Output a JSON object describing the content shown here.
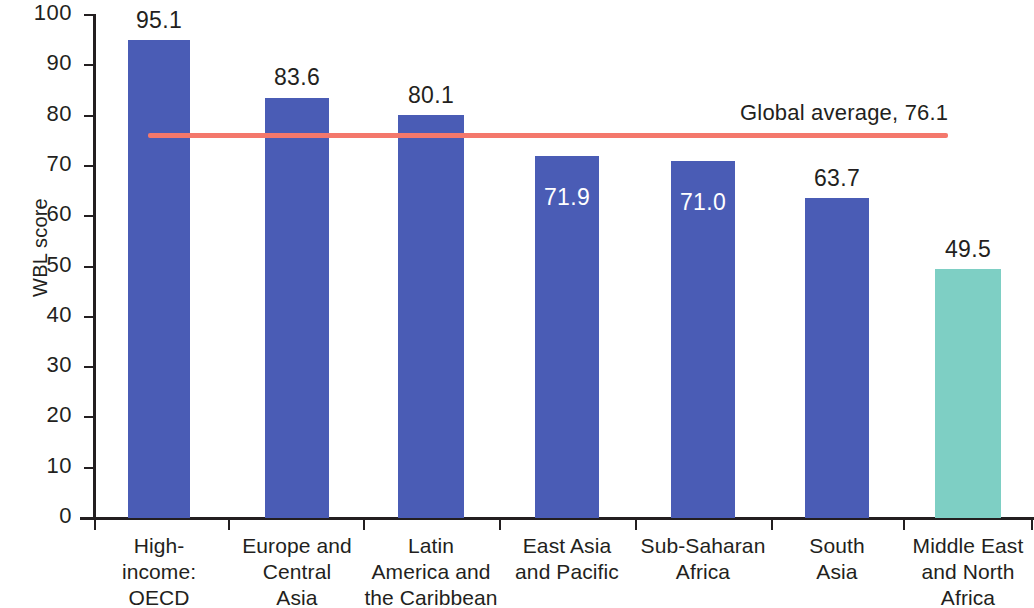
{
  "chart_data": {
    "type": "bar",
    "title": "",
    "subtitle": "",
    "xlabel": "",
    "ylabel": "WBL score",
    "ylim": [
      0,
      100
    ],
    "ytick_labels": [
      "100",
      "90",
      "80",
      "70",
      "60",
      "50",
      "40",
      "30",
      "20",
      "10",
      "0"
    ],
    "ytick_values": [
      100,
      90,
      80,
      70,
      60,
      50,
      40,
      30,
      20,
      10,
      0
    ],
    "grid": false,
    "legend": "none",
    "categories": [
      "High-income: OECD",
      "Europe and Central Asia",
      "Latin America and the Caribbean",
      "East Asia and Pacific",
      "Sub-Saharan Africa",
      "South Asia",
      "Middle East and North Africa"
    ],
    "category_lines": [
      [
        "High-",
        "income:",
        "OECD"
      ],
      [
        "Europe and",
        "Central",
        "Asia"
      ],
      [
        "Latin",
        "America and",
        "the Caribbean"
      ],
      [
        "East Asia",
        "and Pacific"
      ],
      [
        "Sub-Saharan",
        "Africa"
      ],
      [
        "South",
        "Asia"
      ],
      [
        "Middle East",
        "and North",
        "Africa"
      ]
    ],
    "values": [
      95.1,
      83.6,
      80.1,
      71.9,
      71.0,
      63.7,
      49.5
    ],
    "value_labels": [
      "95.1",
      "83.6",
      "80.1",
      "71.9",
      "71.0",
      "63.7",
      "49.5"
    ],
    "value_label_position": [
      "above",
      "above",
      "above",
      "inside",
      "inside",
      "above",
      "above"
    ],
    "bar_colors": [
      "#4a5cb5",
      "#4a5cb5",
      "#4a5cb5",
      "#4a5cb5",
      "#4a5cb5",
      "#4a5cb5",
      "#7ecfc4"
    ],
    "reference_line": {
      "label": "Global average, 76.1",
      "value": 76.1,
      "color": "#f4786c"
    },
    "colors": {
      "bar_blue": "#4a5cb5",
      "bar_teal": "#7ecfc4",
      "reference_red": "#f4786c",
      "axis": "#231f20",
      "text": "#231f20",
      "inside_label": "#ffffff",
      "background": "#ffffff"
    }
  }
}
